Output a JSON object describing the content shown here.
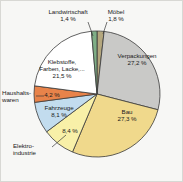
{
  "chart_data": {
    "type": "pie",
    "title": "",
    "subtitle": "",
    "xlabel": "",
    "ylabel": "",
    "legend_position": "none",
    "grid": false,
    "units": "%",
    "decimal_separator": ",",
    "start_angle_deg": 0,
    "direction": "clockwise",
    "categories": [
      "Möbel",
      "Verpackungen",
      "Bau",
      "Elektroindustrie",
      "Fahrzeuge",
      "Haushaltswaren",
      "Klebstoffe, Farben, Lacke,...",
      "Landwirtschaft"
    ],
    "values": [
      1.8,
      27.2,
      27.3,
      8.4,
      8.1,
      4.2,
      21.5,
      1.4
    ],
    "colors": [
      "#b4a77e",
      "#c9c9c7",
      "#f0d98c",
      "#f8f0a8",
      "#c2dcee",
      "#e8834a",
      "#ffffff",
      "#7fae86"
    ],
    "slices": [
      {
        "label": "Möbel",
        "value": 1.8,
        "value_text": "1,8 %",
        "color": "#b4a77e"
      },
      {
        "label": "Verpackungen",
        "value": 27.2,
        "value_text": "27,2 %",
        "color": "#c9c9c7"
      },
      {
        "label": "Bau",
        "value": 27.3,
        "value_text": "27,3 %",
        "color": "#f0d98c"
      },
      {
        "label": "Elektroindustrie",
        "value": 8.4,
        "value_text": "8,4 %",
        "color": "#f8f0a8"
      },
      {
        "label": "Fahrzeuge",
        "value": 8.1,
        "value_text": "8,1 %",
        "color": "#c2dcee"
      },
      {
        "label": "Haushaltswaren",
        "value": 4.2,
        "value_text": "4,2 %",
        "color": "#e8834a"
      },
      {
        "label": "Klebstoffe, Farben, Lacke,...",
        "value": 21.5,
        "value_text": "21,5 %",
        "color": "#ffffff"
      },
      {
        "label": "Landwirtschaft",
        "value": 1.4,
        "value_text": "1,4 %",
        "color": "#7fae86"
      }
    ]
  },
  "labels": {
    "landwirtschaft": {
      "name": "Landwirtschaft",
      "pct": "1,4 %"
    },
    "moebel": {
      "name": "Möbel",
      "pct": "1,8 %"
    },
    "verpackungen": {
      "name": "Verpackungen",
      "pct": "27,2 %"
    },
    "bau": {
      "name": "Bau",
      "pct": "27,3 %"
    },
    "elektro": {
      "name_line1": "Elektro-",
      "name_line2": "industrie",
      "pct": "8,4 %"
    },
    "fahrzeuge": {
      "name": "Fahrzeuge",
      "pct": "8,1 %"
    },
    "haushalt": {
      "name_line1": "Haushalts-",
      "name_line2": "waren",
      "pct": "4,2 %"
    },
    "klebstoffe": {
      "name_line1": "Klebstoffe,",
      "name_line2": "Farben, Lacke,...",
      "pct": "21,5 %"
    }
  },
  "style": {
    "background": "#f7f7f5",
    "border": "#d8d8d4",
    "outline": "#3a3a3a",
    "text": "#1b1b1b"
  }
}
